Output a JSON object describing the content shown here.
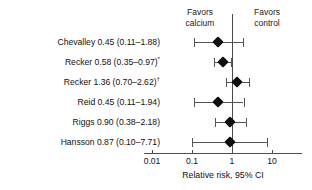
{
  "figure": {
    "header_left": "Favors\ncalcium",
    "header_right": "Favors\ncontrol",
    "axis_title": "Relative risk, 95% CI"
  },
  "chart_data": {
    "type": "forest",
    "title": "",
    "xlabel": "Relative risk, 95% CI",
    "ylabel": "",
    "xscale": "log",
    "xlim": [
      0.01,
      10
    ],
    "xticks": [
      0.01,
      0.1,
      1,
      10
    ],
    "xticklabels": [
      "0.01",
      "0.1",
      "1",
      "10"
    ],
    "reference_line": 1,
    "grid": false,
    "legend": "none",
    "annotations": {
      "left_side": "Favors calcium",
      "right_side": "Favors control",
      "footnote_markers": [
        "*",
        "†"
      ]
    },
    "studies": [
      {
        "name": "Chevalley",
        "estimate": 0.45,
        "ci_low": 0.11,
        "ci_high": 1.88,
        "marker": "",
        "label": "Chevalley 0.45 (0.11–1.88)"
      },
      {
        "name": "Recker",
        "estimate": 0.58,
        "ci_low": 0.35,
        "ci_high": 0.97,
        "marker": "*",
        "label": "Recker 0.58 (0.35–0.97)"
      },
      {
        "name": "Recker",
        "estimate": 1.36,
        "ci_low": 0.7,
        "ci_high": 2.62,
        "marker": "†",
        "label": "Recker 1.36 (0.70–2.62)"
      },
      {
        "name": "Reid",
        "estimate": 0.45,
        "ci_low": 0.11,
        "ci_high": 1.94,
        "marker": "",
        "label": "Reid 0.45 (0.11–1.94)"
      },
      {
        "name": "Riggs",
        "estimate": 0.9,
        "ci_low": 0.38,
        "ci_high": 2.18,
        "marker": "",
        "label": "Riggs 0.90 (0.38–2.18)"
      },
      {
        "name": "Hansson",
        "estimate": 0.87,
        "ci_low": 0.1,
        "ci_high": 7.71,
        "marker": "",
        "label": "Hansson 0.87 (0.10–7.71)"
      }
    ]
  },
  "colors": {
    "marker": "#0d0d0d",
    "line": "#555555",
    "axis": "#4d4d4d",
    "text": "#111111",
    "background": "#ffffff"
  }
}
